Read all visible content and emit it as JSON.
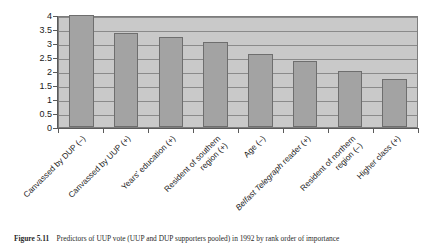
{
  "figure": {
    "caption_label": "Figure 5.11",
    "caption_text": "Predictors of UUP vote (UUP and DUP supporters pooled) in 1992 by rank order of importance"
  },
  "chart_data": {
    "type": "bar",
    "title": "",
    "xlabel": "",
    "ylabel": "",
    "ylim": [
      0,
      4
    ],
    "ytick_labels": [
      "0",
      "0.5",
      "1",
      "1.5",
      "2",
      "2.5",
      "3",
      "3.5",
      "4"
    ],
    "ytick_values": [
      0,
      0.5,
      1,
      1.5,
      2,
      2.5,
      3,
      3.5,
      4
    ],
    "grid": true,
    "legend": "none",
    "bar_color": "#a3a3a3",
    "plot_background": "#c9c9c9",
    "categories": [
      "Canvassed by DUP (–)",
      "Canvassed by UUP (+)",
      "Years' education (+)",
      "Resident of southern region (+)",
      "Age (–)",
      "Belfast Telegraph reader (+)",
      "Resident of northern region (–)",
      "Higher class (+)"
    ],
    "category_lines": [
      [
        "Canvassed by DUP (–)"
      ],
      [
        "Canvassed by UUP (+)"
      ],
      [
        "Years' education (+)"
      ],
      [
        "Resident of southern",
        "region (+)"
      ],
      [
        "Age (–)"
      ],
      [
        "Belfast Telegraph reader (+)"
      ],
      [
        "Resident of northern",
        "region (–)"
      ],
      [
        "Higher class (+)"
      ]
    ],
    "italic_prefix": {
      "5": "Belfast Telegraph"
    },
    "values": [
      4.0,
      3.35,
      3.2,
      3.05,
      2.6,
      2.35,
      2.0,
      1.7
    ]
  }
}
